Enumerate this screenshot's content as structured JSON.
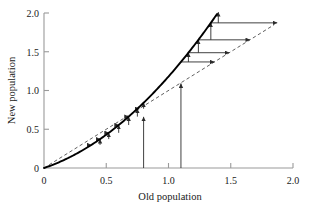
{
  "chart_data": {
    "type": "line",
    "title": "",
    "xlabel": "Old population",
    "ylabel": "New population",
    "xlim": [
      0,
      2.0
    ],
    "ylim": [
      0,
      2.0
    ],
    "grid": false,
    "legend": "none",
    "xticks": [
      "0",
      "0.5",
      "1.0",
      "1.5",
      "2.0"
    ],
    "xtick_values": [
      0,
      0.5,
      1.0,
      1.5,
      2.0
    ],
    "yticks": [
      "0",
      "0.5",
      "1.0",
      "1.5",
      "2.0"
    ],
    "ytick_values": [
      0,
      0.5,
      1.0,
      1.5,
      2.0
    ],
    "series": [
      {
        "name": "map-curve",
        "style": "solid",
        "color": "#000000",
        "x": [
          0.0,
          0.1,
          0.2,
          0.3,
          0.4,
          0.5,
          0.6,
          0.7,
          0.8,
          0.9,
          1.0,
          1.1,
          1.2,
          1.3,
          1.4,
          1.5,
          1.55
        ],
        "values": [
          0.0,
          0.073,
          0.156,
          0.249,
          0.352,
          0.465,
          0.588,
          0.721,
          0.864,
          1.017,
          1.18,
          1.353,
          1.536,
          1.729,
          1.932,
          2.145,
          2.0
        ]
      },
      {
        "name": "identity-line",
        "style": "dashed",
        "color": "#555555",
        "x": [
          0.0,
          1.85
        ],
        "values": [
          0.0,
          1.85
        ]
      }
    ],
    "annotations": [
      {
        "name": "vertical-arrow-start-a",
        "x": 0.8,
        "y0": 0.0,
        "y1": 0.66
      },
      {
        "name": "vertical-arrow-start-b",
        "x": 1.1,
        "y0": 0.0,
        "y1": 1.09
      },
      {
        "name": "cobweb-sequence-lower",
        "start_x": 0.38,
        "points": [
          0.38,
          0.45,
          0.52,
          0.6,
          0.68,
          0.75,
          0.8
        ]
      },
      {
        "name": "cobweb-sequence-upper",
        "start_x": 1.1,
        "points": [
          1.1,
          1.16,
          1.24,
          1.34,
          1.4
        ]
      }
    ]
  },
  "axes": {
    "x_title": "Old population",
    "y_title": "New population"
  }
}
